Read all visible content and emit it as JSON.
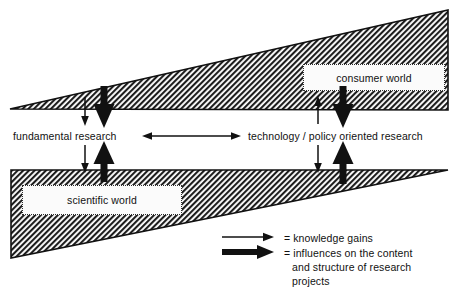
{
  "figure": {
    "type": "conceptual-diagram",
    "background_color": "#ffffff",
    "ink_color": "#111111"
  },
  "wedges": [
    {
      "id": "consumer-wedge",
      "name": "consumer world wedge",
      "label": "consumer world",
      "orientation": "widening-to-the-right",
      "fill": "diagonal-hatch",
      "hatch_color": "#1a1a1a",
      "points": "10,109 448,10 448,110"
    },
    {
      "id": "scientific-wedge",
      "name": "scientific world wedge",
      "label": "scientific world",
      "orientation": "widening-to-the-left",
      "fill": "diagonal-hatch",
      "hatch_color": "#1a1a1a",
      "points": "11,170 448,170 11,258"
    }
  ],
  "callouts": {
    "consumer": "consumer world",
    "scientific": "scientific world"
  },
  "axis_labels": {
    "left": "fundamental research",
    "right": "technology / policy oriented research"
  },
  "spectrum_arrow": {
    "name": "research-spectrum-arrow",
    "style": "double-headed-thin",
    "from_x": 143,
    "to_x": 240,
    "y": 136
  },
  "flow_arrows": [
    {
      "id": "a1",
      "kind": "thin",
      "direction": "down",
      "x": 85,
      "from_y": 97,
      "to_y": 124,
      "meaning": "knowledge gains"
    },
    {
      "id": "a2",
      "kind": "thick",
      "direction": "down",
      "x": 104,
      "from_y": 86,
      "to_y": 126,
      "meaning": "influences on the content and structure of research projects"
    },
    {
      "id": "a3",
      "kind": "thin",
      "direction": "down",
      "x": 85,
      "from_y": 145,
      "to_y": 172,
      "meaning": "knowledge gains"
    },
    {
      "id": "a4",
      "kind": "thick",
      "direction": "up",
      "x": 104,
      "from_y": 178,
      "to_y": 143,
      "meaning": "influences on the content and structure of research projects"
    },
    {
      "id": "a5",
      "kind": "thin",
      "direction": "up",
      "x": 318,
      "from_y": 124,
      "to_y": 97,
      "meaning": "knowledge gains"
    },
    {
      "id": "a6",
      "kind": "thick",
      "direction": "down",
      "x": 343,
      "from_y": 86,
      "to_y": 126,
      "meaning": "influences on the content and structure of research projects"
    },
    {
      "id": "a7",
      "kind": "thin",
      "direction": "down",
      "x": 318,
      "from_y": 145,
      "to_y": 172,
      "meaning": "knowledge gains"
    },
    {
      "id": "a8",
      "kind": "thick",
      "direction": "up",
      "x": 343,
      "from_y": 183,
      "to_y": 143,
      "meaning": "influences on the content and structure of research projects"
    }
  ],
  "legend": {
    "rows": [
      {
        "arrow": "thin",
        "text": "= knowledge gains"
      },
      {
        "arrow": "thick",
        "text": "= influences on the content"
      }
    ],
    "line_1": "= knowledge gains",
    "line_2": "= influences on the content",
    "line_3": "and structure of research",
    "line_4": "projects",
    "thin_arrow": {
      "x1": 222,
      "x2": 272,
      "y": 237
    },
    "thick_arrow": {
      "x1": 222,
      "x2": 272,
      "y": 252
    }
  }
}
